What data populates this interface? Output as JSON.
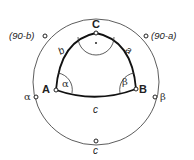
{
  "diagram": {
    "vertices": {
      "A": "A",
      "B": "B",
      "C": "C"
    },
    "sides": {
      "a": "a",
      "b": "b",
      "c": "c"
    },
    "angles": {
      "alpha": "α",
      "beta": "β"
    },
    "outer_labels": {
      "top_left": "(90-b)",
      "top_right": "(90-a)",
      "left": "α",
      "right": "β",
      "bottom": "c"
    },
    "colors": {
      "stroke": "#222222",
      "background": "#ffffff"
    }
  }
}
